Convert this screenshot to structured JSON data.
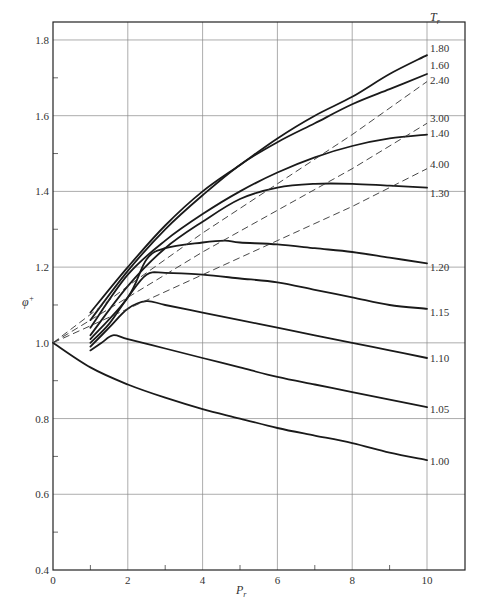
{
  "chart_data": {
    "type": "line",
    "title": "",
    "xlabel": "P_r",
    "ylabel": "φ⁺",
    "xlim": [
      0,
      11
    ],
    "ylim": [
      0.4,
      1.85
    ],
    "grid": true,
    "x_ticks": [
      "0",
      "2",
      "4",
      "6",
      "8",
      "10"
    ],
    "y_ticks": [
      "0.4",
      "0.6",
      "0.8",
      "1.0",
      "1.2",
      "1.4",
      "1.6",
      "1.8"
    ],
    "legend_title": "T_r",
    "series": [
      {
        "name": "1.80",
        "style": "solid",
        "x": [
          1.0,
          2.0,
          3.0,
          4.0,
          5.0,
          6.0,
          7.0,
          8.0,
          9.0,
          10.0
        ],
        "y": [
          1.08,
          1.2,
          1.31,
          1.4,
          1.47,
          1.54,
          1.6,
          1.65,
          1.71,
          1.76
        ]
      },
      {
        "name": "1.60",
        "style": "solid",
        "x": [
          1.0,
          2.0,
          3.0,
          4.0,
          5.0,
          6.0,
          7.0,
          8.0,
          9.0,
          10.0
        ],
        "y": [
          1.06,
          1.19,
          1.3,
          1.39,
          1.47,
          1.53,
          1.58,
          1.63,
          1.67,
          1.71
        ]
      },
      {
        "name": "1.40",
        "style": "solid",
        "x": [
          1.0,
          2.0,
          3.0,
          4.0,
          5.0,
          6.0,
          7.0,
          8.0,
          9.0,
          10.0
        ],
        "y": [
          1.04,
          1.18,
          1.27,
          1.34,
          1.4,
          1.45,
          1.49,
          1.52,
          1.54,
          1.55
        ]
      },
      {
        "name": "1.30",
        "style": "solid",
        "x": [
          1.0,
          2.0,
          3.0,
          4.0,
          5.0,
          6.0,
          7.0,
          8.0,
          9.0,
          10.0
        ],
        "y": [
          1.02,
          1.15,
          1.25,
          1.32,
          1.38,
          1.41,
          1.42,
          1.42,
          1.415,
          1.41
        ]
      },
      {
        "name": "1.20",
        "style": "solid",
        "x": [
          1.0,
          2.0,
          2.5,
          3.0,
          4.0,
          4.6,
          5.0,
          6.0,
          7.0,
          8.0,
          9.0,
          10.0
        ],
        "y": [
          1.01,
          1.12,
          1.22,
          1.25,
          1.265,
          1.27,
          1.265,
          1.26,
          1.25,
          1.24,
          1.225,
          1.21
        ]
      },
      {
        "name": "1.15",
        "style": "solid",
        "x": [
          1.0,
          1.5,
          2.0,
          2.5,
          3.0,
          4.0,
          5.0,
          6.0,
          7.0,
          8.0,
          9.0,
          10.0
        ],
        "y": [
          1.0,
          1.05,
          1.12,
          1.18,
          1.185,
          1.18,
          1.17,
          1.16,
          1.14,
          1.12,
          1.1,
          1.09
        ]
      },
      {
        "name": "1.10",
        "style": "solid",
        "x": [
          1.0,
          1.5,
          2.0,
          2.5,
          3.0,
          4.0,
          5.0,
          6.0,
          7.0,
          8.0,
          9.0,
          10.0
        ],
        "y": [
          0.99,
          1.04,
          1.09,
          1.11,
          1.1,
          1.08,
          1.06,
          1.04,
          1.02,
          1.0,
          0.98,
          0.96
        ]
      },
      {
        "name": "1.05",
        "style": "solid",
        "x": [
          1.0,
          1.3,
          1.6,
          2.0,
          3.0,
          4.0,
          5.0,
          6.0,
          7.0,
          8.0,
          9.0,
          10.0
        ],
        "y": [
          0.98,
          1.0,
          1.02,
          1.01,
          0.985,
          0.96,
          0.935,
          0.91,
          0.89,
          0.87,
          0.85,
          0.83
        ]
      },
      {
        "name": "1.00",
        "style": "solid",
        "x": [
          0.0,
          1.0,
          2.0,
          3.0,
          4.0,
          5.0,
          6.0,
          7.0,
          8.0,
          9.0,
          10.0
        ],
        "y": [
          1.0,
          0.935,
          0.89,
          0.855,
          0.825,
          0.8,
          0.775,
          0.755,
          0.735,
          0.71,
          0.69
        ]
      },
      {
        "name": "2.40",
        "style": "dashed",
        "x": [
          0.0,
          2.0,
          4.0,
          6.0,
          8.0,
          10.0
        ],
        "y": [
          1.0,
          1.15,
          1.29,
          1.42,
          1.55,
          1.69
        ]
      },
      {
        "name": "3.00",
        "style": "dashed",
        "x": [
          0.0,
          2.0,
          4.0,
          6.0,
          8.0,
          10.0
        ],
        "y": [
          1.0,
          1.12,
          1.24,
          1.35,
          1.46,
          1.58
        ]
      },
      {
        "name": "4.00",
        "style": "dashed",
        "x": [
          0.0,
          2.0,
          4.0,
          6.0,
          8.0,
          10.0
        ],
        "y": [
          1.0,
          1.09,
          1.18,
          1.27,
          1.36,
          1.46
        ]
      }
    ]
  }
}
